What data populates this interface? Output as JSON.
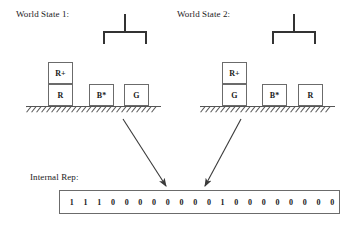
{
  "diagram": {
    "world_state_1": {
      "title": "World State 1:",
      "gripper": "gripper-claw",
      "blocks": [
        {
          "label": "R+",
          "x": 48,
          "y": 62,
          "stack": "left",
          "level": 2
        },
        {
          "label": "R",
          "x": 48,
          "y": 84,
          "stack": "left",
          "level": 1
        },
        {
          "label": "B*",
          "x": 89,
          "y": 84,
          "stack": "middle",
          "level": 1
        },
        {
          "label": "G",
          "x": 124,
          "y": 84,
          "stack": "right",
          "level": 1
        }
      ],
      "ground_label": "hatched-ground"
    },
    "world_state_2": {
      "title": "World State 2:",
      "gripper": "gripper-claw",
      "blocks": [
        {
          "label": "R+",
          "x": 222,
          "y": 62,
          "stack": "left",
          "level": 2
        },
        {
          "label": "G",
          "x": 222,
          "y": 84,
          "stack": "left",
          "level": 1
        },
        {
          "label": "B*",
          "x": 262,
          "y": 84,
          "stack": "middle",
          "level": 1
        },
        {
          "label": "R",
          "x": 298,
          "y": 84,
          "stack": "right",
          "level": 1
        }
      ],
      "ground_label": "hatched-ground"
    },
    "internal_rep": {
      "title": "Internal Rep:",
      "bits": [
        "1",
        "1",
        "1",
        "0",
        "0",
        "0",
        "0",
        "0",
        "0",
        "0",
        "0",
        "1",
        "0",
        "0",
        "0",
        "0",
        "0",
        "0",
        "0",
        "0"
      ],
      "bit_string": "11100000000100000000",
      "bit_count": 20
    },
    "arrows": [
      {
        "name": "arrow-from-world-state-1",
        "from_x": 123,
        "from_y": 119,
        "to_x": 166,
        "to_y": 186
      },
      {
        "name": "arrow-from-world-state-2",
        "from_x": 241,
        "from_y": 119,
        "to_x": 205,
        "to_y": 186
      }
    ],
    "colors": {
      "line": "#555555",
      "block_border": "#6b6b6b",
      "text": "#1a1a1a",
      "gripper": "#333333",
      "background": "#ffffff"
    }
  }
}
